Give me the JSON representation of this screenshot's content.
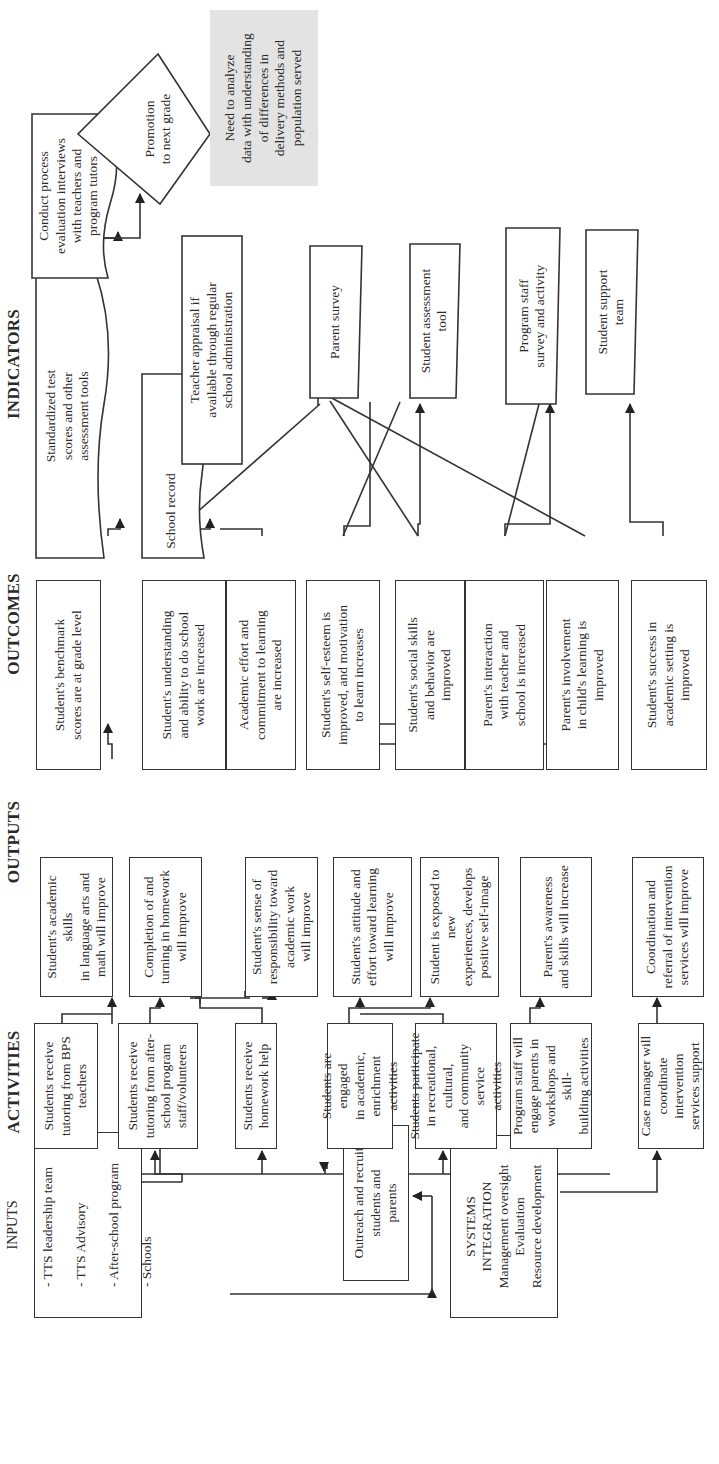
{
  "headers": {
    "activities": "ACTIVITIES",
    "outputs": "OUTPUTS",
    "outcomes": "OUTCOMES",
    "indicators": "INDICATORS"
  },
  "inputs": {
    "title": "INPUTS",
    "items": [
      "- TTS leadership team",
      "- TTS Advisory",
      "- After-school program",
      "- Schools"
    ]
  },
  "outreach": "Outreach and recruit\nstudents and\nparents",
  "systems_integration": {
    "title": "SYSTEMS\nINTEGRATION",
    "items": [
      "Management oversight",
      "Evaluation",
      "Resource development"
    ]
  },
  "activities": [
    "Students receive\ntutoring from BPS\nteachers",
    "Students receive\ntutoring from after-\nschool program\nstaff/volunteers",
    "Students receive\nhomework help",
    "Students are engaged\nin academic, enrichment\nactivities",
    "Students participate\nin recreational, cultural,\nand community service\nactivities",
    "Program staff will\nengage parents in\nworkshops and skill-\nbuilding activities",
    "Case manager will\ncoordinate intervention\nservices support"
  ],
  "outputs": [
    "Student's academic skills\nin language arts and\nmath will improve",
    "Completion of and\nturning in homework\nwill improve",
    "Student's sense of\nresponsibility toward\nacademic work\nwill improve",
    "Student's attitude and\neffort toward learning\nwill improve",
    "Student is exposed to new\nexperiences, develops\npositive self-image",
    "Parent's awareness\nand skills will increase",
    "Coordination and\nreferral of intervention\nservices will improve"
  ],
  "outcomes": [
    "Student's benchmark\nscores are at grade level",
    "Student's understanding\nand ability to do school\nwork are increased",
    "Academic effort and\ncommitment to learning\nare increased",
    "Student's self-esteem is\nimproved, and motivation\nto learn increases",
    "Student's social skills\nand behavior are\nimproved",
    "Parent's interaction\nwith teacher and\nschool is increased",
    "Parent's involvement\nin child's learning is\nimproved",
    "Student's success in\nacademic setting is\nimproved"
  ],
  "indicators": {
    "standardized_tests": "Standardized test\nscores and other\nassessment tools",
    "process_interviews": "Conduct process\nevaluation interviews\nwith teachers and\nprogram tutors",
    "promotion": "Promotion\nto next grade",
    "school_record": "School record",
    "teacher_appraisal": "Teacher appraisal if\navailable through regular\nschool administration",
    "parent_survey": "Parent survey",
    "student_assessment": "Student assessment\ntool",
    "program_staff_survey": "Program staff\nsurvey and activity",
    "student_support_team": "Student support\nteam"
  },
  "note": "Need to analyze\ndata with understanding\nof differences in\ndelivery methods and\npopulation served"
}
